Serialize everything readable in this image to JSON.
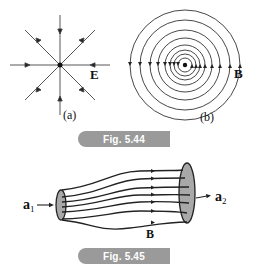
{
  "figure_544": {
    "caption": "Fig. 5.44",
    "part_a": {
      "field_label": "E",
      "sub_label": "(a)"
    },
    "part_b": {
      "field_label": "B",
      "sub_label": "(b)"
    }
  },
  "figure_545": {
    "caption": "Fig. 5.45",
    "field_label": "B",
    "area_1_label": "a",
    "area_1_sub": "1",
    "area_2_label": "a",
    "area_2_sub": "2"
  },
  "colors": {
    "line": "#222222",
    "badge": "#9a9a9a",
    "cap_fill": "#a8a8a8"
  }
}
